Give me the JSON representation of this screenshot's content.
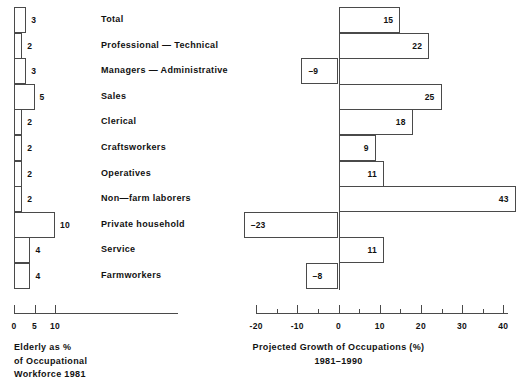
{
  "chart_data": {
    "type": "bar",
    "title": "",
    "orientation": "horizontal",
    "layout": "butterfly-dual-panel",
    "grid": false,
    "legend": "none",
    "categories": [
      "Total",
      "Professional — Technical",
      "Managers — Administrative",
      "Sales",
      "Clerical",
      "Craftsworkers",
      "Operatives",
      "Non—farm laborers",
      "Private household",
      "Service",
      "Farmworkers"
    ],
    "series": [
      {
        "name": "Elderly as % of Occupational Workforce 1981",
        "panel": "left",
        "xlabel": "Elderly as % of Occupational Workforce 1981",
        "xlim": [
          0,
          13
        ],
        "ticks": [
          0,
          5,
          10
        ],
        "tick_labels": [
          "0",
          "5",
          "10"
        ],
        "values": [
          3,
          2,
          3,
          5,
          2,
          2,
          2,
          2,
          10,
          4,
          4
        ],
        "value_labels": [
          "3",
          "2",
          "3",
          "5",
          "2",
          "2",
          "2",
          "2",
          "10",
          "4",
          "4"
        ]
      },
      {
        "name": "Projected Growth of Occupations (%) 1981–1990",
        "panel": "right",
        "xlabel": "Projected Growth of Occupations (%)",
        "xlim": [
          -25,
          44
        ],
        "ticks": [
          -20,
          -10,
          0,
          10,
          20,
          30,
          40
        ],
        "tick_labels": [
          "-20",
          "-10",
          "0",
          "10",
          "20",
          "30",
          "40"
        ],
        "minor_ticks": [
          -15,
          -5,
          5,
          15,
          25,
          35
        ],
        "values": [
          15,
          22,
          -9,
          25,
          18,
          9,
          11,
          43,
          -23,
          11,
          -8
        ],
        "value_labels": [
          "15",
          "22",
          "–9",
          "25",
          "18",
          "9",
          "11",
          "43",
          "–23",
          "11",
          "–8"
        ]
      }
    ]
  },
  "left_panel": {
    "caption_lines": [
      "Elderly as %",
      "of Occupational",
      "Workforce 1981"
    ]
  },
  "right_panel": {
    "caption_lines": [
      "Projected Growth of Occupations (%)",
      "1981–1990"
    ]
  },
  "style": {
    "background": "#ffffff",
    "bar_stroke": "#4a4a4a",
    "bar_fill": "#ffffff",
    "text_color": "#111111",
    "axis_color": "#4a4a4a"
  }
}
